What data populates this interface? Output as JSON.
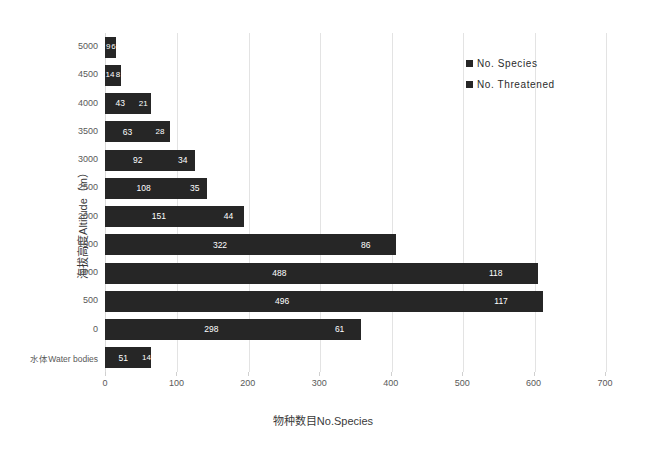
{
  "chart_data": {
    "type": "bar",
    "orientation": "horizontal",
    "stacked": true,
    "title": "",
    "xlabel": "物种数目No.Species",
    "ylabel": "海拔高度Altitude（m）",
    "xlim": [
      0,
      700
    ],
    "xticks": [
      0,
      100,
      200,
      300,
      400,
      500,
      600,
      700
    ],
    "grid": true,
    "legend_position": "top-right",
    "categories": [
      "5000",
      "4500",
      "4000",
      "3500",
      "3000",
      "2500",
      "2000",
      "1500",
      "1000",
      "500",
      "0",
      "水体Water bodies"
    ],
    "series": [
      {
        "name": "No. Species",
        "values": [
          9,
          14,
          43,
          63,
          92,
          108,
          151,
          322,
          488,
          496,
          298,
          51
        ]
      },
      {
        "name": "No. Threatened",
        "values": [
          6,
          8,
          21,
          28,
          34,
          35,
          44,
          86,
          118,
          117,
          61,
          14
        ]
      }
    ],
    "bar_labels": [
      {
        "category": "5000",
        "species": "9",
        "threatened": "6"
      },
      {
        "category": "4500",
        "species": "14",
        "threatened": "8"
      },
      {
        "category": "4000",
        "species": "43",
        "threatened": "21"
      },
      {
        "category": "3500",
        "species": "63",
        "threatened": "28"
      },
      {
        "category": "3000",
        "species": "92",
        "threatened": "34"
      },
      {
        "category": "2500",
        "species": "108",
        "threatened": "35"
      },
      {
        "category": "2000",
        "species": "151",
        "threatened": "44"
      },
      {
        "category": "1500",
        "species": "322",
        "threatened": "86"
      },
      {
        "category": "1000",
        "species": "488",
        "threatened": "118"
      },
      {
        "category": "500",
        "species": "496",
        "threatened": "117"
      },
      {
        "category": "0",
        "species": "298",
        "threatened": "61"
      },
      {
        "category": "水体Water bodies",
        "species": "51",
        "threatened": "14"
      }
    ],
    "colors": {
      "series_1": "#262626",
      "series_2": "#262626",
      "gridline": "#e3e3e3",
      "axis_text": "#595959",
      "background": "#ffffff",
      "bar_label_text": "#ffffff"
    }
  },
  "legend": {
    "items": [
      {
        "label": "No. Species"
      },
      {
        "label": "No. Threatened"
      }
    ]
  },
  "axes": {
    "x_title": "物种数目No.Species",
    "y_title": "海拔高度Altitude（m）",
    "x_tick_labels": [
      "0",
      "100",
      "200",
      "300",
      "400",
      "500",
      "600",
      "700"
    ],
    "y_tick_labels": [
      "5000",
      "4500",
      "4000",
      "3500",
      "3000",
      "2500",
      "2000",
      "1500",
      "1000",
      "500",
      "0",
      "水体Water bodies"
    ]
  }
}
